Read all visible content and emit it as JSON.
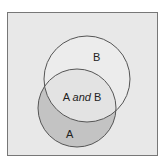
{
  "diagram": {
    "type": "venn",
    "sets": [
      {
        "id": "A",
        "label": "A"
      },
      {
        "id": "B",
        "label": "B"
      }
    ],
    "intersection": {
      "label_left": "A",
      "label_connector": "and",
      "label_right": "B"
    },
    "colors": {
      "background": "#e8e8e8",
      "border": "#777777",
      "set_a_only": "#c3c3c3",
      "set_b": "#ececec",
      "stroke": "#555555"
    }
  }
}
